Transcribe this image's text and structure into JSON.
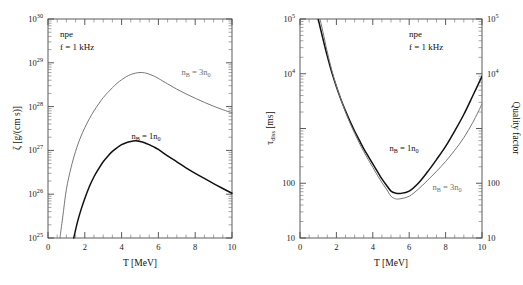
{
  "figure": {
    "panels": [
      {
        "id": "left",
        "annotations": {
          "matter": "npe",
          "frequency": "f = 1 kHz"
        },
        "xaxis": {
          "label": "T [MeV]",
          "ticks": [
            "0",
            "2",
            "4",
            "6",
            "8",
            "10"
          ],
          "values": [
            0,
            2,
            4,
            6,
            8,
            10
          ],
          "range": [
            0,
            10
          ]
        },
        "yaxis": {
          "label_base": "ζ [g/(cm s)]",
          "label_symbol": "ζ",
          "label_units": "[g/(cm s)]",
          "ticks": [
            "10",
            "10",
            "10",
            "10",
            "10",
            "10"
          ],
          "tick_exponents": [
            "25",
            "26",
            "27",
            "28",
            "29",
            "30"
          ],
          "range_log10": [
            25,
            30
          ]
        },
        "series": [
          {
            "name": "nB = 3n0",
            "label_prefix": "n",
            "label_sub1": "B",
            "label_mid": " = 3n",
            "label_sub2": "0",
            "color": "#777777",
            "style": "thin"
          },
          {
            "name": "nB = 1n0",
            "label_prefix": "n",
            "label_sub1": "B",
            "label_mid": " = 1n",
            "label_sub2": "0",
            "color": "#111111",
            "style": "thick"
          }
        ]
      },
      {
        "id": "right",
        "annotations": {
          "matter": "npe",
          "frequency": "f = 1 kHz"
        },
        "xaxis": {
          "label": "T [MeV]",
          "ticks": [
            "0",
            "2",
            "4",
            "6",
            "8",
            "10"
          ],
          "values": [
            0,
            2,
            4,
            6,
            8,
            10
          ],
          "range": [
            0,
            10
          ]
        },
        "yaxis_left": {
          "label_symbol": "τ",
          "label_sub": "diss",
          "label_units": " [ms]",
          "ticks": [
            "10",
            "100",
            "10",
            "10"
          ],
          "tick_exponents": [
            "",
            "",
            "4",
            "5"
          ],
          "range_log10": [
            1,
            5
          ]
        },
        "yaxis_right": {
          "label": "Quality factor",
          "ticks": [
            "10",
            "100",
            "10",
            "10"
          ],
          "tick_exponents": [
            "",
            "",
            "4",
            "5"
          ],
          "range_log10": [
            1,
            5
          ]
        },
        "series": [
          {
            "name": "nB = 1n0",
            "label_prefix": "n",
            "label_sub1": "B",
            "label_mid": " = 1n",
            "label_sub2": "0",
            "color": "#111111",
            "style": "thick"
          },
          {
            "name": "nB = 3n0",
            "label_prefix": "n",
            "label_sub1": "B",
            "label_mid": " = 3n",
            "label_sub2": "0",
            "color": "#777777",
            "style": "thin"
          }
        ]
      }
    ]
  },
  "chart_data": [
    {
      "type": "line",
      "panel": "left",
      "title": "",
      "xlabel": "T [MeV]",
      "ylabel": "ζ [g/(cm s)]",
      "xscale": "linear",
      "yscale": "log",
      "xlim": [
        0,
        10
      ],
      "ylim": [
        1e+25,
        1e+30
      ],
      "xticks": [
        0,
        2,
        4,
        6,
        8,
        10
      ],
      "yticks": [
        1e+25,
        1e+26,
        1e+27,
        1e+28,
        1e+29,
        1e+30
      ],
      "grid": false,
      "legend": "inline-curve-labels",
      "annotations": [
        "npe",
        "f = 1 kHz"
      ],
      "series": [
        {
          "name": "n_B = 3n_0",
          "color": "#777777",
          "x": [
            0.65,
            0.8,
            1.0,
            1.25,
            1.5,
            1.75,
            2.0,
            2.25,
            2.5,
            2.75,
            3.0,
            3.25,
            3.5,
            3.75,
            4.0,
            4.25,
            4.5,
            4.75,
            5.0,
            5.25,
            5.5,
            5.75,
            6.0,
            6.5,
            7.0,
            7.5,
            8.0,
            8.5,
            9.0,
            9.5,
            10.0
          ],
          "y": [
            1e+25,
            3e+25,
            1.3e+26,
            4e+26,
            9.5e+26,
            1.9e+27,
            3.3e+27,
            5.3e+27,
            8e+27,
            1.15e+28,
            1.6e+28,
            2.1e+28,
            2.7e+28,
            3.4e+28,
            4.1e+28,
            4.8e+28,
            5.4e+28,
            5.8e+28,
            6e+28,
            5.9e+28,
            5.5e+28,
            5e+28,
            4.4e+28,
            3.3e+28,
            2.5e+28,
            1.95e+28,
            1.55e+28,
            1.25e+28,
            1.02e+28,
            8.5e+27,
            7.2e+27
          ]
        },
        {
          "name": "n_B = 1n_0",
          "color": "#111111",
          "x": [
            1.4,
            1.6,
            1.8,
            2.0,
            2.25,
            2.5,
            2.75,
            3.0,
            3.25,
            3.5,
            3.75,
            4.0,
            4.25,
            4.5,
            4.75,
            5.0,
            5.25,
            5.5,
            5.75,
            6.0,
            6.5,
            7.0,
            7.5,
            8.0,
            8.5,
            9.0,
            9.5,
            10.0
          ],
          "y": [
            1e+25,
            2.3e+25,
            4.5e+25,
            8e+25,
            1.5e+26,
            2.5e+26,
            3.8e+26,
            5.5e+26,
            7.4e+26,
            9.5e+26,
            1.15e+27,
            1.35e+27,
            1.5e+27,
            1.6e+27,
            1.65e+27,
            1.6e+27,
            1.5e+27,
            1.35e+27,
            1.2e+27,
            1.05e+27,
            7.5e+26,
            5.5e+26,
            4e+26,
            3e+26,
            2.3e+26,
            1.75e+26,
            1.35e+26,
            1.05e+26
          ]
        }
      ]
    },
    {
      "type": "line",
      "panel": "right",
      "title": "",
      "xlabel": "T [MeV]",
      "ylabel": "τ_diss [ms]",
      "ylabel_right": "Quality factor",
      "xscale": "linear",
      "yscale": "log",
      "xlim": [
        0,
        10
      ],
      "ylim": [
        10,
        100000
      ],
      "xticks": [
        0,
        2,
        4,
        6,
        8,
        10
      ],
      "yticks": [
        10,
        100,
        10000,
        100000
      ],
      "grid": false,
      "legend": "inline-curve-labels",
      "annotations": [
        "npe",
        "f = 1 kHz"
      ],
      "series": [
        {
          "name": "n_B = 1n_0",
          "color": "#111111",
          "x": [
            1.0,
            1.25,
            1.5,
            1.75,
            2.0,
            2.25,
            2.5,
            2.75,
            3.0,
            3.25,
            3.5,
            3.75,
            4.0,
            4.25,
            4.5,
            4.75,
            5.0,
            5.25,
            5.5,
            6.0,
            6.5,
            7.0,
            7.5,
            8.0,
            8.5,
            9.0,
            9.5,
            10.0
          ],
          "y": [
            100000,
            45000,
            21000,
            10500,
            5800,
            3400,
            2100,
            1350,
            900,
            620,
            430,
            310,
            225,
            165,
            120,
            92,
            72,
            66,
            65,
            72,
            100,
            160,
            270,
            470,
            900,
            1800,
            4000,
            9000
          ]
        },
        {
          "name": "n_B = 3n_0",
          "color": "#777777",
          "x": [
            1.1,
            1.25,
            1.5,
            1.75,
            2.0,
            2.25,
            2.5,
            2.75,
            3.0,
            3.25,
            3.5,
            3.75,
            4.0,
            4.25,
            4.5,
            4.75,
            5.0,
            5.25,
            5.5,
            6.0,
            6.5,
            7.0,
            7.5,
            8.0,
            8.5,
            9.0,
            9.5,
            10.0
          ],
          "y": [
            100000,
            60000,
            25000,
            11500,
            6000,
            3400,
            2000,
            1250,
            820,
            550,
            380,
            270,
            195,
            140,
            103,
            78,
            58,
            52,
            52,
            58,
            78,
            112,
            165,
            250,
            400,
            680,
            1300,
            2800
          ]
        }
      ]
    }
  ]
}
